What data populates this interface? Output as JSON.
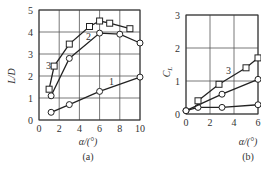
{
  "chart_data": [
    {
      "type": "line",
      "panel": "(a)",
      "xlabel": "α/(°)",
      "ylabel": "L/D",
      "xlim": [
        0,
        10
      ],
      "ylim": [
        0,
        5
      ],
      "xticks": [
        0,
        2,
        4,
        6,
        8,
        10
      ],
      "yticks": [
        0,
        1,
        2,
        3,
        4,
        5
      ],
      "grid": true,
      "series": [
        {
          "name": "1",
          "marker": "circle",
          "points": [
            [
              1.2,
              0.35
            ],
            [
              3,
              0.7
            ],
            [
              6,
              1.3
            ],
            [
              10,
              1.95
            ]
          ]
        },
        {
          "name": "2",
          "marker": "circle",
          "points": [
            [
              1.2,
              1.1
            ],
            [
              3,
              2.8
            ],
            [
              6,
              3.95
            ],
            [
              8,
              3.9
            ],
            [
              10,
              3.5
            ]
          ]
        },
        {
          "name": "3",
          "marker": "square",
          "points": [
            [
              1,
              1.4
            ],
            [
              1.5,
              2.45
            ],
            [
              3,
              3.45
            ],
            [
              5,
              4.25
            ],
            [
              6,
              4.5
            ],
            [
              7,
              4.4
            ],
            [
              9,
              4.15
            ]
          ]
        }
      ]
    },
    {
      "type": "line",
      "panel": "(b)",
      "xlabel": "α/(°)",
      "ylabel": "C_L",
      "xlim": [
        0,
        6
      ],
      "ylim": [
        0,
        3
      ],
      "xticks": [
        0,
        2,
        4,
        6
      ],
      "yticks": [
        0,
        1,
        2,
        3
      ],
      "grid": true,
      "series": [
        {
          "name": "1",
          "marker": "circle",
          "points": [
            [
              0,
              0.1
            ],
            [
              1,
              0.2
            ],
            [
              3,
              0.2
            ],
            [
              6,
              0.28
            ]
          ]
        },
        {
          "name": "2",
          "marker": "circle",
          "points": [
            [
              0,
              0.1
            ],
            [
              3,
              0.6
            ],
            [
              6,
              1.05
            ]
          ]
        },
        {
          "name": "3",
          "marker": "square",
          "points": [
            [
              1,
              0.4
            ],
            [
              2.75,
              0.9
            ],
            [
              5,
              1.4
            ],
            [
              6,
              1.7
            ]
          ]
        }
      ]
    }
  ],
  "labels": {
    "a_ylabel": "L/D",
    "a_xlabel": "α/(°)",
    "a_caption": "(a)",
    "b_ylabel": "C",
    "b_ylabel_sub": "L",
    "b_xlabel": "α/(°)",
    "b_caption": "(b)",
    "curve1": "1",
    "curve2": "2",
    "curve3": "3"
  }
}
